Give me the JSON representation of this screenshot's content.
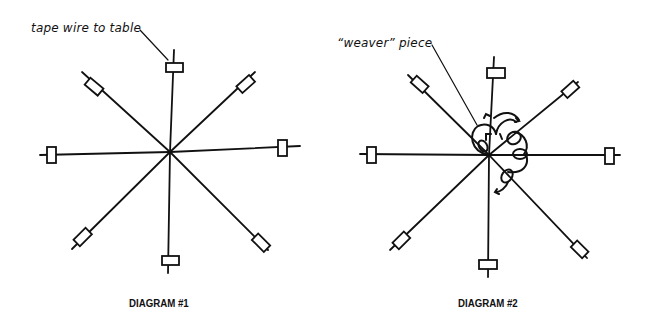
{
  "diagrams": [
    {
      "caption": "DIAGRAM #1",
      "annotation": "tape wire to table"
    },
    {
      "caption": "DIAGRAM #2",
      "annotation": "“weaver” piece"
    }
  ],
  "colors": {
    "ink": "#111111",
    "background": "#ffffff"
  }
}
